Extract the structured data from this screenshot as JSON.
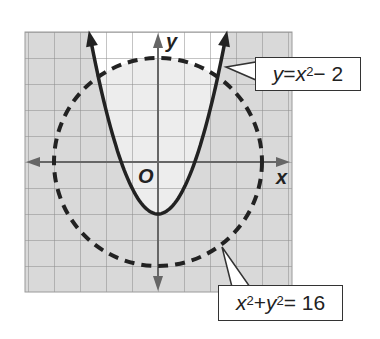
{
  "chart_data": {
    "type": "line",
    "title": "",
    "xlabel": "x",
    "ylabel": "y",
    "origin_label": "O",
    "xlim": [
      -5,
      5
    ],
    "ylim": [
      -5,
      5
    ],
    "grid": true,
    "unit_px": 26,
    "series": [
      {
        "name": "y = x^2 - 2",
        "kind": "parabola",
        "style": "solid",
        "color": "#222222",
        "equation": "y = x^2 - 2",
        "vertex": [
          0,
          -2
        ],
        "x": [
          -2.6,
          -2,
          -1,
          0,
          1,
          2,
          2.6
        ],
        "y": [
          4.76,
          2,
          -1,
          -2,
          -1,
          2,
          4.76
        ]
      },
      {
        "name": "x^2 + y^2 = 16",
        "kind": "circle",
        "style": "dashed",
        "color": "#222222",
        "equation": "x^2 + y^2 = 16",
        "center": [
          0,
          0
        ],
        "radius": 4
      }
    ],
    "shading": {
      "outside_parabola": "#d9d9d9",
      "inside_parabola_inside_circle": "#ededed",
      "inside_parabola_outside_circle": "#ffffff"
    }
  },
  "labels": {
    "parabola": {
      "y": "y",
      "eq": " = ",
      "x": "x",
      "exp": "2",
      "rest": " − 2"
    },
    "circle": {
      "x": "x",
      "exp1": "2",
      "plus": " + ",
      "y": "y",
      "exp2": "2",
      "rest": " = 16"
    },
    "x_axis": "x",
    "y_axis": "y",
    "origin": "O"
  }
}
